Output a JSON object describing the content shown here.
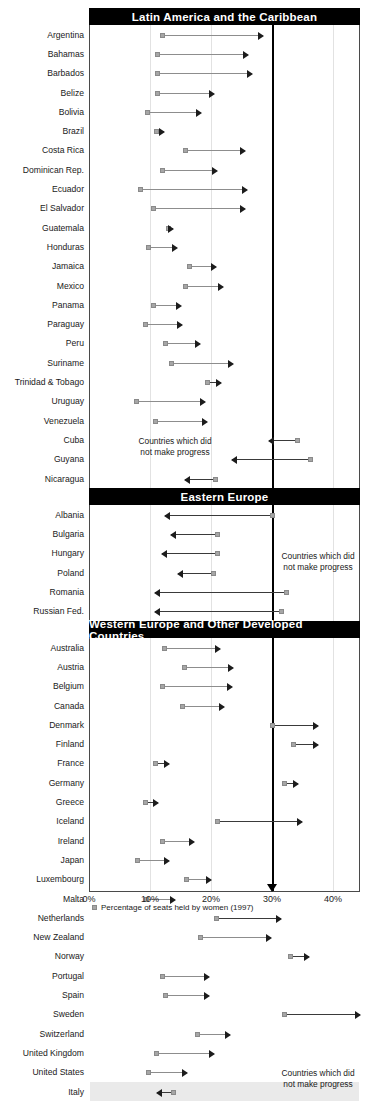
{
  "chart_data": {
    "type": "bar",
    "xlabel": "",
    "ylabel": "",
    "xlim": [
      0,
      45
    ],
    "xticks": [
      0,
      10,
      20,
      30,
      40
    ],
    "xtick_labels": [
      "0%",
      "10%",
      "20%",
      "30%",
      "40%"
    ],
    "grid": true,
    "target_line": 30,
    "legend_position": "bottom-left",
    "legend_entries": [
      "Percentage of seats held by women (1997)"
    ],
    "no_progress_note": "Countries which did not make progress",
    "sections": [
      {
        "name": "Latin America and the Caribbean",
        "rows": [
          {
            "country": "Argentina",
            "start": 12.0,
            "end": 28.5,
            "progress": true
          },
          {
            "country": "Bahamas",
            "start": 11.3,
            "end": 26.0,
            "progress": true
          },
          {
            "country": "Barbados",
            "start": 11.3,
            "end": 26.8,
            "progress": true
          },
          {
            "country": "Belize",
            "start": 11.3,
            "end": 20.5,
            "progress": true
          },
          {
            "country": "Bolivia",
            "start": 9.6,
            "end": 18.3,
            "progress": true
          },
          {
            "country": "Brazil",
            "start": 11.0,
            "end": 12.3,
            "progress": true
          },
          {
            "country": "Costa Rica",
            "start": 15.9,
            "end": 25.6,
            "progress": true
          },
          {
            "country": "Dominican Rep.",
            "start": 12.0,
            "end": 21.0,
            "progress": true
          },
          {
            "country": "Ecuador",
            "start": 8.5,
            "end": 25.9,
            "progress": true
          },
          {
            "country": "El Salvador",
            "start": 10.5,
            "end": 25.6,
            "progress": true
          },
          {
            "country": "Guatemala",
            "start": 13.0,
            "end": 13.8,
            "progress": true
          },
          {
            "country": "Honduras",
            "start": 9.8,
            "end": 14.5,
            "progress": true
          },
          {
            "country": "Jamaica",
            "start": 16.5,
            "end": 20.8,
            "progress": true
          },
          {
            "country": "Mexico",
            "start": 15.9,
            "end": 22.0,
            "progress": true
          },
          {
            "country": "Panama",
            "start": 10.6,
            "end": 15.0,
            "progress": true
          },
          {
            "country": "Paraguay",
            "start": 9.3,
            "end": 15.3,
            "progress": true
          },
          {
            "country": "Peru",
            "start": 12.5,
            "end": 18.2,
            "progress": true
          },
          {
            "country": "Suriname",
            "start": 13.6,
            "end": 23.6,
            "progress": true
          },
          {
            "country": "Trinidad & Tobago",
            "start": 19.4,
            "end": 21.7,
            "progress": true
          },
          {
            "country": "Uruguay",
            "start": 7.8,
            "end": 19.0,
            "progress": true
          },
          {
            "country": "Venezuela",
            "start": 10.9,
            "end": 19.3,
            "progress": true
          },
          {
            "country": "Cuba",
            "start": 34.1,
            "end": 29.5,
            "progress": false
          },
          {
            "country": "Guyana",
            "start": 36.3,
            "end": 23.5,
            "progress": false
          },
          {
            "country": "Nicaragua",
            "start": 20.7,
            "end": 15.8,
            "progress": false
          }
        ]
      },
      {
        "name": "Eastern Europe",
        "rows": [
          {
            "country": "Albania",
            "start": 30.0,
            "end": 12.4,
            "progress": false
          },
          {
            "country": "Bulgaria",
            "start": 21.1,
            "end": 13.5,
            "progress": false
          },
          {
            "country": "Hungary",
            "start": 21.1,
            "end": 12.0,
            "progress": false
          },
          {
            "country": "Poland",
            "start": 20.4,
            "end": 14.6,
            "progress": false
          },
          {
            "country": "Romania",
            "start": 32.3,
            "end": 10.9,
            "progress": false
          },
          {
            "country": "Russian Fed.",
            "start": 31.6,
            "end": 10.9,
            "progress": false
          }
        ]
      },
      {
        "name": "Western Europe and Other Developed Countries",
        "rows": [
          {
            "country": "Australia",
            "start": 12.3,
            "end": 21.4,
            "progress": true
          },
          {
            "country": "Austria",
            "start": 15.7,
            "end": 23.6,
            "progress": true
          },
          {
            "country": "Belgium",
            "start": 12.1,
            "end": 23.5,
            "progress": true
          },
          {
            "country": "Canada",
            "start": 15.4,
            "end": 22.2,
            "progress": true
          },
          {
            "country": "Denmark",
            "start": 30.0,
            "end": 37.6,
            "progress": true
          },
          {
            "country": "Finland",
            "start": 33.5,
            "end": 37.5,
            "progress": true
          },
          {
            "country": "France",
            "start": 10.9,
            "end": 13.1,
            "progress": true
          },
          {
            "country": "Germany",
            "start": 32.1,
            "end": 34.3,
            "progress": true
          },
          {
            "country": "Greece",
            "start": 9.2,
            "end": 11.3,
            "progress": true
          },
          {
            "country": "Iceland",
            "start": 21.1,
            "end": 34.9,
            "progress": true
          },
          {
            "country": "Ireland",
            "start": 12.1,
            "end": 17.2,
            "progress": true
          },
          {
            "country": "Japan",
            "start": 7.9,
            "end": 13.1,
            "progress": true
          },
          {
            "country": "Luxembourg",
            "start": 16.0,
            "end": 20.0,
            "progress": true
          },
          {
            "country": "Malta",
            "start": 9.4,
            "end": 14.1,
            "progress": true
          },
          {
            "country": "Netherlands",
            "start": 20.9,
            "end": 31.4,
            "progress": true
          },
          {
            "country": "New Zealand",
            "start": 18.3,
            "end": 29.9,
            "progress": true
          },
          {
            "country": "Norway",
            "start": 33.0,
            "end": 36.1,
            "progress": true
          },
          {
            "country": "Portugal",
            "start": 12.1,
            "end": 19.6,
            "progress": true
          },
          {
            "country": "Spain",
            "start": 12.6,
            "end": 19.6,
            "progress": true
          },
          {
            "country": "Sweden",
            "start": 32.0,
            "end": 44.4,
            "progress": true
          },
          {
            "country": "Switzerland",
            "start": 17.8,
            "end": 23.1,
            "progress": true
          },
          {
            "country": "United Kingdom",
            "start": 11.0,
            "end": 20.5,
            "progress": true
          },
          {
            "country": "United States",
            "start": 9.8,
            "end": 16.0,
            "progress": true
          },
          {
            "country": "Italy",
            "start": 13.8,
            "end": 11.2,
            "progress": false
          }
        ]
      }
    ]
  },
  "axis": {
    "ticks": [
      "0%",
      "10%",
      "20%",
      "30%",
      "40%"
    ]
  },
  "legend": {
    "marker_label": "Percentage of seats held by women (1997)"
  },
  "notes": {
    "no_progress_line1": "Countries which did",
    "no_progress_line2": "not make progress"
  },
  "sections_labels": {
    "s0": "Latin America and the Caribbean",
    "s1": "Eastern Europe",
    "s2": "Western Europe and Other Developed Countries"
  }
}
